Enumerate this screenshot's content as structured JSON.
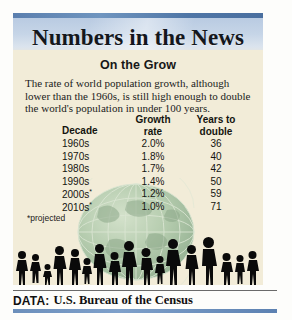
{
  "header": {
    "title": "Numbers in the News"
  },
  "article": {
    "subtitle": "On the Grow",
    "lede": "The rate of world population growth, although lower than the 1960s, is still high enough to double the world's population in under 100 years.",
    "footnote": "*projected"
  },
  "source": {
    "label": "DATA:",
    "text": "U.S. Bureau of the Census"
  },
  "artwork": {
    "globe": "globe-wireframe-graphic",
    "crowd": "people-silhouettes-graphic"
  },
  "colors": {
    "banner_blue": "#b9cbe2",
    "rule_blue": "#5b7fae",
    "paper_cream": "#f2ecd8",
    "globe_green": "#7fae86",
    "silhouette_black": "#0a0a0a"
  },
  "chart_data": {
    "type": "table",
    "title": "On the Grow",
    "columns": [
      "Decade",
      "Growth rate",
      "Years to double"
    ],
    "categories": [
      "1960s",
      "1970s",
      "1980s",
      "1990s",
      "2000s*",
      "2010s*"
    ],
    "rows": [
      {
        "decade": "1960s",
        "growth_rate": "2.0%",
        "years_to_double": "36"
      },
      {
        "decade": "1970s",
        "growth_rate": "1.8%",
        "years_to_double": "40"
      },
      {
        "decade": "1980s",
        "growth_rate": "1.7%",
        "years_to_double": "42"
      },
      {
        "decade": "1990s",
        "growth_rate": "1.4%",
        "years_to_double": "50"
      },
      {
        "decade": "2000s*",
        "growth_rate": "1.2%",
        "years_to_double": "59"
      },
      {
        "decade": "2010s*",
        "growth_rate": "1.0%",
        "years_to_double": "71"
      }
    ],
    "series": [
      {
        "name": "Growth rate (%)",
        "values": [
          2.0,
          1.8,
          1.7,
          1.4,
          1.2,
          1.0
        ]
      },
      {
        "name": "Years to double",
        "values": [
          36,
          40,
          42,
          50,
          59,
          71
        ]
      }
    ],
    "xlabel": "Decade",
    "ylabel": "",
    "annotations": [
      "*projected"
    ],
    "grid": false,
    "legend": "none"
  }
}
